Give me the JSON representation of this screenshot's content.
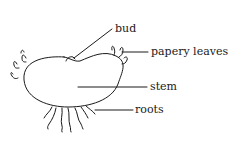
{
  "diagram": {
    "labels": {
      "bud": "bud",
      "papery_leaves": "papery leaves",
      "stem": "stem",
      "roots": "roots"
    },
    "colors": {
      "stroke": "#1a1a1a",
      "background": "#ffffff"
    }
  }
}
